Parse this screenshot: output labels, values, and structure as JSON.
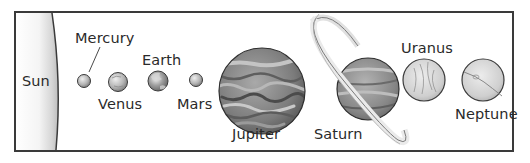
{
  "diagram": {
    "title": "",
    "labels": {
      "sun": "Sun",
      "mercury": "Mercury",
      "venus": "Venus",
      "earth": "Earth",
      "mars": "Mars",
      "jupiter": "Jupiter",
      "saturn": "Saturn",
      "uranus": "Uranus",
      "neptune": "Neptune"
    }
  }
}
